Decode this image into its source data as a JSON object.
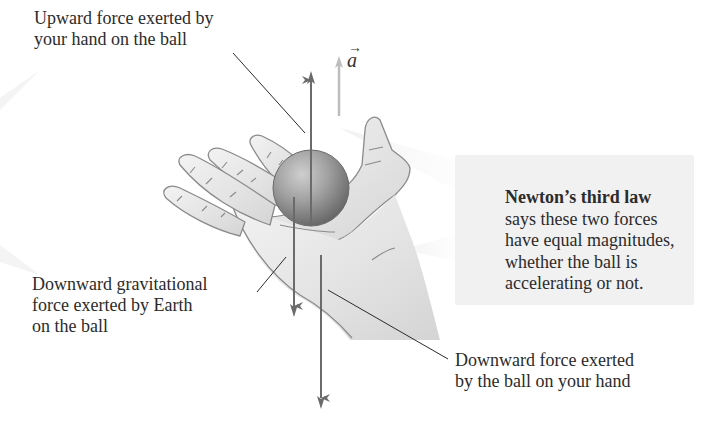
{
  "figure": {
    "labels": {
      "upward_force": [
        "Upward force exerted by",
        "your hand on the ball"
      ],
      "gravitational_force": [
        "Downward gravitational",
        "force exerted by Earth",
        "on the ball"
      ],
      "ball_on_hand_force": [
        "Downward force exerted",
        "by the ball on your hand"
      ]
    },
    "callout": {
      "title": "Newton’s third law",
      "lines": [
        "says these two forces",
        "have equal magnitudes,",
        "whether the ball is",
        "accelerating or not."
      ]
    },
    "acceleration": {
      "symbol": "a",
      "vector_mark": "→"
    },
    "vectors": [
      {
        "name": "upward-force-on-ball",
        "direction": "up",
        "color": "#6b6b6b"
      },
      {
        "name": "gravitational-force-on-ball",
        "direction": "down",
        "color": "#6b6b6b"
      },
      {
        "name": "ball-force-on-hand",
        "direction": "down",
        "color": "#6b6b6b"
      },
      {
        "name": "acceleration",
        "direction": "up",
        "color": "#bdbdbd"
      }
    ],
    "colors": {
      "callout_bg": "#f1f1f1",
      "arrow": "#6b6b6b",
      "accel_arrow": "#bdbdbd",
      "hand_fill": "#e9e9e9",
      "hand_outline": "#8a8a8a",
      "ball_light": "#c2c2c2",
      "ball_dark": "#6a6a6a",
      "text": "#2b2b2b"
    }
  }
}
